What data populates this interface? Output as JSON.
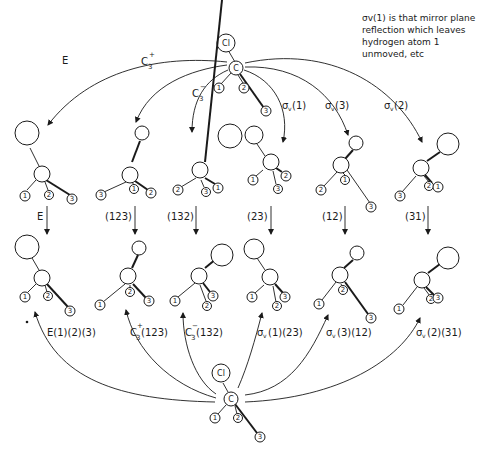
{
  "note": {
    "lines": [
      "σv(1) is that mirror plane",
      "reflection which leaves",
      "hydrogen atom 1",
      "unmoved, etc"
    ]
  },
  "top_molecule": {
    "chlorine": "Cl",
    "carbon": "C",
    "hydrogens": [
      "1",
      "2",
      "3"
    ]
  },
  "bottom_molecule": {
    "chlorine": "Cl",
    "carbon": "C",
    "hydrogens": [
      "1",
      "2",
      "3"
    ]
  },
  "symmetry_operations": [
    {
      "label": "E",
      "sup": "",
      "sub": "",
      "suffix": ""
    },
    {
      "label": "C",
      "sup": "+",
      "sub": "3",
      "suffix": ""
    },
    {
      "label": "C",
      "sup": "−",
      "sub": "3",
      "suffix": ""
    },
    {
      "label": "σ",
      "sup": "",
      "sub": "v",
      "suffix": "(1)"
    },
    {
      "label": "σ",
      "sup": "",
      "sub": "v",
      "suffix": "(3)"
    },
    {
      "label": "σ",
      "sup": "",
      "sub": "v",
      "suffix": "(2)"
    }
  ],
  "permutations": [
    "E",
    "(123)",
    "(132)",
    "(23)",
    "(12)",
    "(31)"
  ],
  "combined_labels": [
    {
      "main": "E(1)(2)(3)",
      "sup": "",
      "sub": "",
      "rest": ""
    },
    {
      "main": "C",
      "sup": "+",
      "sub": "3",
      "rest": "(123)"
    },
    {
      "main": "C",
      "sup": "−",
      "sub": "3",
      "rest": "(132)"
    },
    {
      "main": "σ",
      "sup": "",
      "sub": "v",
      "rest": "(1)(23)"
    },
    {
      "main": "σ",
      "sup": "",
      "sub": "v",
      "rest": "(3)(12)"
    },
    {
      "main": "σ",
      "sup": "",
      "sub": "v",
      "rest": "(2)(31)"
    }
  ],
  "row1_molecules": [
    {
      "h_left": "1",
      "h_mid": "2",
      "h_far": "3"
    },
    {
      "h_left": "3",
      "h_mid": "1",
      "h_far": "2"
    },
    {
      "h_left": "2",
      "h_mid": "3",
      "h_far": "1"
    },
    {
      "h_left": "1",
      "h_mid": "3",
      "h_far": "2"
    },
    {
      "h_left": "2",
      "h_mid": "1",
      "h_far": "3"
    },
    {
      "h_left": "3",
      "h_mid": "2",
      "h_far": "1"
    }
  ],
  "row2_molecules": [
    {
      "h_left": "1",
      "h_mid": "2",
      "h_far": "3"
    },
    {
      "h_left": "1",
      "h_mid": "2",
      "h_far": "3"
    },
    {
      "h_left": "1",
      "h_mid": "2",
      "h_far": "3"
    },
    {
      "h_left": "1",
      "h_mid": "2",
      "h_far": "3"
    },
    {
      "h_left": "1",
      "h_mid": "2",
      "h_far": "3"
    },
    {
      "h_left": "1",
      "h_mid": "2",
      "h_far": "3"
    }
  ]
}
